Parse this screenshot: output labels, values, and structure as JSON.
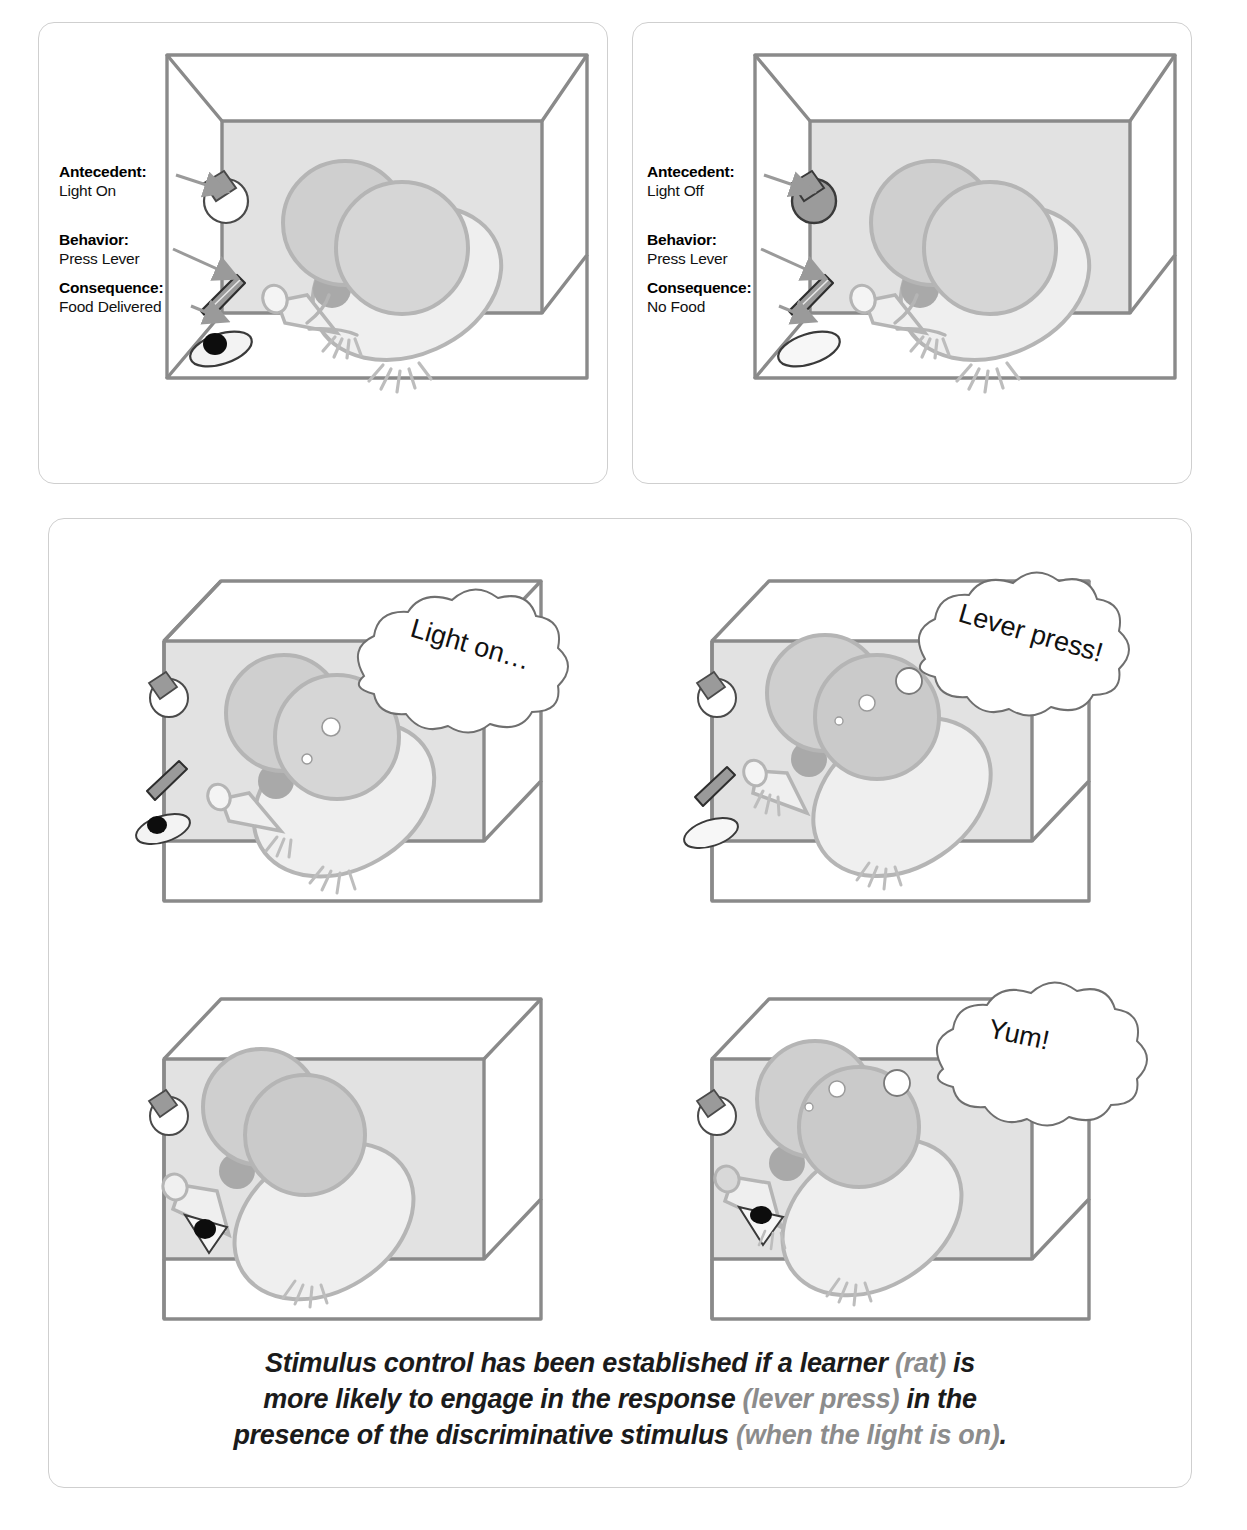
{
  "figure": {
    "domain_type": "diagram"
  },
  "panels": {
    "light_on": {
      "name": "Light On panel",
      "light_state": "on",
      "food_present": true,
      "labels": [
        {
          "term": "Antecedent:",
          "value": "Light On"
        },
        {
          "term": "Behavior:",
          "value": "Press Lever"
        },
        {
          "term": "Consequence:",
          "value": "Food Delivered"
        }
      ]
    },
    "light_off": {
      "name": "Light Off panel",
      "light_state": "off",
      "food_present": false,
      "labels": [
        {
          "term": "Antecedent:",
          "value": "Light Off"
        },
        {
          "term": "Behavior:",
          "value": "Press Lever"
        },
        {
          "term": "Consequence:",
          "value": "No Food"
        }
      ]
    },
    "sequence": {
      "name": "Four step sequence panel",
      "steps": [
        {
          "id": "step-1",
          "thought": "Light on…",
          "light_state": "on",
          "food_present": true,
          "has_bubble": true,
          "rat_pose": "observing"
        },
        {
          "id": "step-2",
          "thought": "Lever press!",
          "light_state": "on",
          "food_present": false,
          "has_bubble": true,
          "rat_pose": "pressing-lever"
        },
        {
          "id": "step-3",
          "thought": "",
          "light_state": "on",
          "food_present": false,
          "has_bubble": false,
          "rat_pose": "turning"
        },
        {
          "id": "step-4",
          "thought": "Yum!",
          "light_state": "on",
          "food_present": true,
          "has_bubble": true,
          "rat_pose": "eating"
        }
      ]
    }
  },
  "caption": {
    "line1_a": "Stimulus control has been established if a learner ",
    "line1_b": "(rat)",
    "line1_c": " is",
    "line2_a": "more likely to engage in the response ",
    "line2_b": "(lever press)",
    "line2_c": " in the",
    "line3_a": "presence of the discriminative stimulus ",
    "line3_b": "(when the light is on)",
    "line3_c": "."
  },
  "colors": {
    "panel_border": "#cfcfcf",
    "box_line": "#8a8a8a",
    "box_fill": "#e2e2e2",
    "rat_body": "#efefef",
    "rat_outline": "#b5b5b5",
    "rat_head_fill": "#cfcfcf",
    "eye": "#9f9f9f",
    "arrow": "#9a9a9a",
    "bulb_on": "#ffffff",
    "bulb_off": "#9b9b9b",
    "food_pellet": "#0d0d0d",
    "text": "#111111",
    "caption_muted": "#8c8c8c"
  }
}
